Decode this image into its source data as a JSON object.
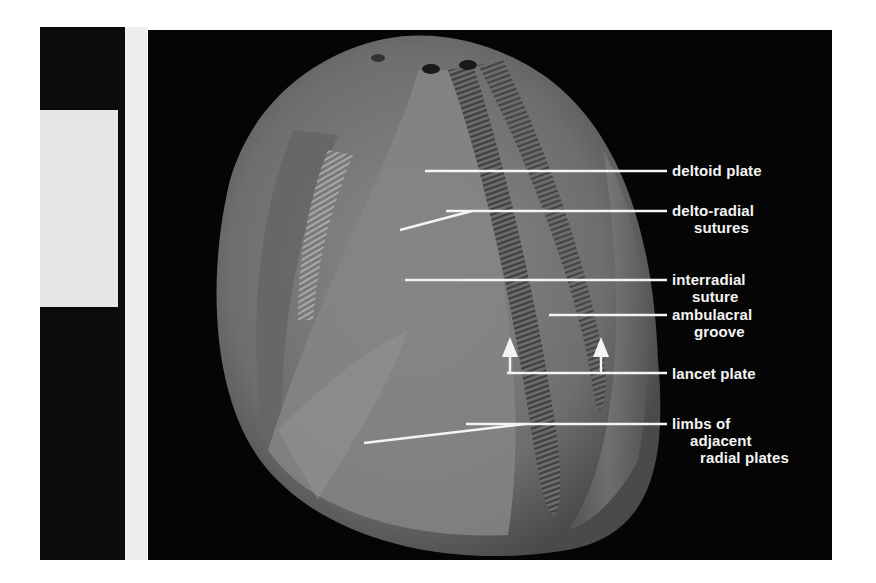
{
  "figure": {
    "colors": {
      "background_panel": "#050505",
      "fossil_base": "#7a7a7a",
      "annotation": "#f4f4f4",
      "left_strip_dark": "#0b0b0b",
      "left_strip_light": "#e6e6e6"
    },
    "labels": [
      {
        "id": "deltoid-plate",
        "line1": "deltoid plate",
        "line2": ""
      },
      {
        "id": "delto-radial-sutures",
        "line1": "delto-radial",
        "line2": "sutures"
      },
      {
        "id": "interradial-suture",
        "line1": "interradial",
        "line2": "suture"
      },
      {
        "id": "ambulacral-groove",
        "line1": "ambulacral",
        "line2": "groove"
      },
      {
        "id": "lancet-plate",
        "line1": "lancet plate",
        "line2": ""
      },
      {
        "id": "limbs-of-adjacent-radial-plates",
        "line1": "limbs of",
        "line2": "adjacent",
        "line3": "radial plates"
      }
    ]
  }
}
